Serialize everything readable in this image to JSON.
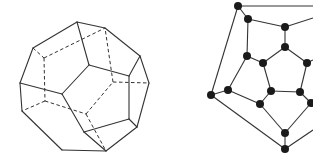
{
  "figure": {
    "left": {
      "name": "dodecahedron",
      "description": "3D wireframe dodecahedron with hidden edges dashed",
      "stroke_color": "#333333",
      "solid_edges": [
        [
          [
            77,
            22
          ],
          [
            105,
            28
          ]
        ],
        [
          [
            105,
            28
          ],
          [
            140,
            56
          ]
        ],
        [
          [
            140,
            56
          ],
          [
            149,
            83
          ]
        ],
        [
          [
            149,
            83
          ],
          [
            137,
            127
          ]
        ],
        [
          [
            137,
            127
          ],
          [
            106,
            151
          ]
        ],
        [
          [
            106,
            151
          ],
          [
            62,
            150
          ]
        ],
        [
          [
            62,
            150
          ],
          [
            22,
            111
          ]
        ],
        [
          [
            22,
            111
          ],
          [
            20,
            83
          ]
        ],
        [
          [
            20,
            83
          ],
          [
            33,
            48
          ]
        ],
        [
          [
            33,
            48
          ],
          [
            77,
            22
          ]
        ],
        [
          [
            77,
            22
          ],
          [
            89,
            65
          ]
        ],
        [
          [
            89,
            65
          ],
          [
            129,
            76
          ]
        ],
        [
          [
            129,
            76
          ],
          [
            140,
            56
          ]
        ],
        [
          [
            129,
            76
          ],
          [
            129,
            119
          ]
        ],
        [
          [
            129,
            119
          ],
          [
            137,
            127
          ]
        ],
        [
          [
            129,
            119
          ],
          [
            84,
            132
          ]
        ],
        [
          [
            84,
            132
          ],
          [
            106,
            151
          ]
        ],
        [
          [
            84,
            132
          ],
          [
            62,
            94
          ]
        ],
        [
          [
            62,
            94
          ],
          [
            89,
            65
          ]
        ],
        [
          [
            62,
            94
          ],
          [
            20,
            83
          ]
        ]
      ],
      "dashed_edges": [
        [
          [
            33,
            48
          ],
          [
            44,
            58
          ]
        ],
        [
          [
            44,
            58
          ],
          [
            105,
            28
          ]
        ],
        [
          [
            44,
            58
          ],
          [
            45,
            101
          ]
        ],
        [
          [
            45,
            101
          ],
          [
            22,
            111
          ]
        ],
        [
          [
            45,
            101
          ],
          [
            86,
            114
          ]
        ],
        [
          [
            86,
            114
          ],
          [
            113,
            82
          ]
        ],
        [
          [
            113,
            82
          ],
          [
            149,
            83
          ]
        ],
        [
          [
            113,
            82
          ],
          [
            105,
            28
          ]
        ],
        [
          [
            86,
            114
          ],
          [
            106,
            151
          ]
        ]
      ]
    },
    "right": {
      "name": "schlegel-diagram-graph",
      "description": "Planar graph of the dodecahedron (Schlegel diagram), partially cropped on the right",
      "node_color": "#1a1a1a",
      "nodes": [
        [
          238,
          6
        ],
        [
          248,
          19
        ],
        [
          285,
          27
        ],
        [
          285,
          47
        ],
        [
          247,
          56
        ],
        [
          263,
          63
        ],
        [
          307,
          63
        ],
        [
          211,
          95
        ],
        [
          228,
          90
        ],
        [
          271,
          91
        ],
        [
          300,
          92
        ],
        [
          260,
          104
        ],
        [
          311,
          103
        ],
        [
          285,
          133
        ],
        [
          285,
          149
        ]
      ],
      "edges": [
        [
          [
            238,
            6
          ],
          [
            313,
            6
          ]
        ],
        [
          [
            238,
            6
          ],
          [
            248,
            19
          ]
        ],
        [
          [
            238,
            6
          ],
          [
            211,
            95
          ]
        ],
        [
          [
            248,
            19
          ],
          [
            285,
            27
          ]
        ],
        [
          [
            248,
            19
          ],
          [
            247,
            56
          ]
        ],
        [
          [
            285,
            27
          ],
          [
            313,
            18
          ]
        ],
        [
          [
            285,
            27
          ],
          [
            285,
            47
          ]
        ],
        [
          [
            285,
            47
          ],
          [
            263,
            63
          ]
        ],
        [
          [
            285,
            47
          ],
          [
            307,
            63
          ]
        ],
        [
          [
            247,
            56
          ],
          [
            263,
            63
          ]
        ],
        [
          [
            247,
            56
          ],
          [
            228,
            90
          ]
        ],
        [
          [
            263,
            63
          ],
          [
            271,
            91
          ]
        ],
        [
          [
            307,
            63
          ],
          [
            300,
            92
          ]
        ],
        [
          [
            307,
            63
          ],
          [
            313,
            60
          ]
        ],
        [
          [
            271,
            91
          ],
          [
            300,
            92
          ]
        ],
        [
          [
            271,
            91
          ],
          [
            260,
            104
          ]
        ],
        [
          [
            300,
            92
          ],
          [
            311,
            103
          ]
        ],
        [
          [
            228,
            90
          ],
          [
            211,
            95
          ]
        ],
        [
          [
            228,
            90
          ],
          [
            260,
            104
          ]
        ],
        [
          [
            211,
            95
          ],
          [
            285,
            149
          ]
        ],
        [
          [
            260,
            104
          ],
          [
            285,
            133
          ]
        ],
        [
          [
            311,
            103
          ],
          [
            285,
            133
          ]
        ],
        [
          [
            285,
            133
          ],
          [
            285,
            149
          ]
        ],
        [
          [
            285,
            149
          ],
          [
            313,
            130
          ]
        ]
      ]
    }
  }
}
